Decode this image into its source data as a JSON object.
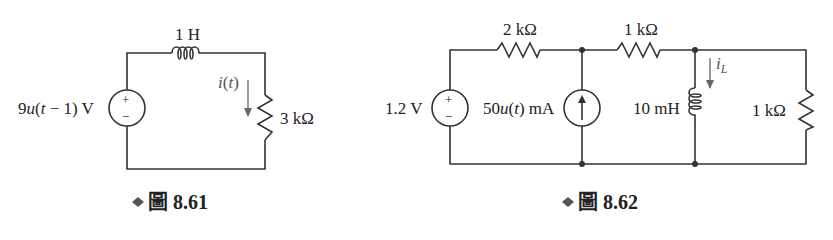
{
  "figures": [
    {
      "id": "fig-8-61",
      "caption": {
        "marker": "◆",
        "label": "圖 8.61"
      },
      "components": {
        "voltage_source": {
          "label": "9u(t − 1) V",
          "label_parts": [
            "9",
            "u",
            "(",
            "t",
            " − 1) V"
          ],
          "plus": "+",
          "minus": "−"
        },
        "inductor": {
          "label": "1 H"
        },
        "resistor": {
          "label": "3 kΩ"
        },
        "current": {
          "label": "i(t)",
          "label_parts": [
            "i",
            "(",
            "t",
            ")"
          ],
          "direction": "down"
        }
      }
    },
    {
      "id": "fig-8-62",
      "caption": {
        "marker": "◆",
        "label": "圖 8.62"
      },
      "components": {
        "voltage_source": {
          "label": "1.2 V",
          "plus": "+",
          "minus": "−"
        },
        "resistor_series_1": {
          "label": "2 kΩ"
        },
        "current_source": {
          "label": "50u(t) mA",
          "label_parts": [
            "50",
            "u",
            "(",
            "t",
            ") mA"
          ],
          "direction": "up"
        },
        "resistor_series_2": {
          "label": "1 kΩ"
        },
        "inductor": {
          "label": "10 mH"
        },
        "inductor_current": {
          "label": "i",
          "subscript": "L",
          "direction": "down"
        },
        "resistor_load": {
          "label": "1 kΩ"
        }
      }
    }
  ],
  "colors": {
    "wire": "#333333",
    "text": "#222222",
    "arrow": "#666666",
    "background": "#ffffff"
  }
}
